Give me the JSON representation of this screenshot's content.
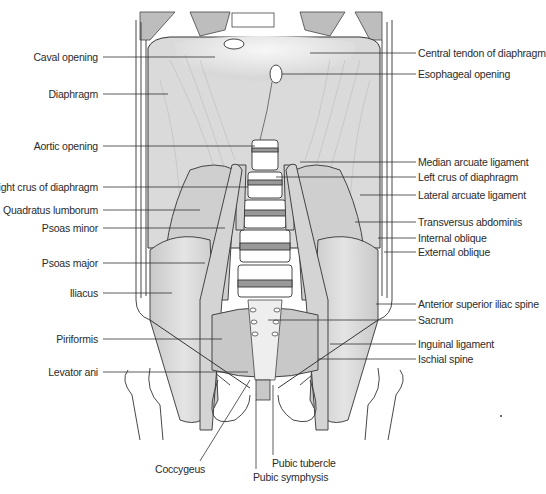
{
  "figure": {
    "labels_left": [
      {
        "text": "Caval opening",
        "x": 100,
        "y": 57,
        "tx": 215,
        "ty": 57
      },
      {
        "text": "Diaphragm",
        "x": 100,
        "y": 94,
        "tx": 168,
        "ty": 94
      },
      {
        "text": "Aortic opening",
        "x": 100,
        "y": 146,
        "tx": 255,
        "ty": 146
      },
      {
        "text": "Right crus of diaphragm",
        "x": 100,
        "y": 187,
        "tx": 248,
        "ty": 187
      },
      {
        "text": "Quadratus lumborum",
        "x": 100,
        "y": 210,
        "tx": 200,
        "ty": 210
      },
      {
        "text": "Psoas minor",
        "x": 100,
        "y": 228,
        "tx": 225,
        "ty": 228
      },
      {
        "text": "Psoas major",
        "x": 100,
        "y": 263,
        "tx": 205,
        "ty": 263
      },
      {
        "text": "Iliacus",
        "x": 100,
        "y": 293,
        "tx": 172,
        "ty": 293
      },
      {
        "text": "Piriformis",
        "x": 100,
        "y": 339,
        "tx": 222,
        "ty": 339
      },
      {
        "text": "Levator ani",
        "x": 100,
        "y": 372,
        "tx": 248,
        "ty": 372
      }
    ],
    "labels_right": [
      {
        "text": "Central tendon of diaphragm",
        "x": 416,
        "y": 53,
        "tx": 310,
        "ty": 53
      },
      {
        "text": "Esophageal opening",
        "x": 416,
        "y": 74,
        "tx": 282,
        "ty": 74
      },
      {
        "text": "Median arcuate ligament",
        "x": 416,
        "y": 162,
        "tx": 300,
        "ty": 162
      },
      {
        "text": "Left crus of diaphragm",
        "x": 416,
        "y": 177,
        "tx": 276,
        "ty": 177
      },
      {
        "text": "Lateral arcuate ligament",
        "x": 416,
        "y": 195,
        "tx": 360,
        "ty": 195
      },
      {
        "text": "Transversus abdominis",
        "x": 416,
        "y": 222,
        "tx": 355,
        "ty": 222
      },
      {
        "text": "Internal oblique",
        "x": 416,
        "y": 238,
        "tx": 378,
        "ty": 238
      },
      {
        "text": "External oblique",
        "x": 416,
        "y": 252,
        "tx": 384,
        "ty": 252
      },
      {
        "text": "Anterior superior iliac spine",
        "x": 416,
        "y": 304,
        "tx": 376,
        "ty": 304
      },
      {
        "text": "Sacrum",
        "x": 416,
        "y": 320,
        "tx": 268,
        "ty": 320
      },
      {
        "text": "Inguinal ligament",
        "x": 416,
        "y": 344,
        "tx": 330,
        "ty": 344
      },
      {
        "text": "Ischial spine",
        "x": 416,
        "y": 359,
        "tx": 318,
        "ty": 359
      }
    ],
    "labels_bottom": [
      {
        "text": "Coccygeus",
        "x": 155,
        "y": 469,
        "tx": 250,
        "ty": 380
      },
      {
        "text": "Pubic tubercle",
        "x": 272,
        "y": 463,
        "tx": 273,
        "ty": 385
      },
      {
        "text": "Pubic symphysis",
        "x": 253,
        "y": 477,
        "tx": 256,
        "ty": 400
      }
    ]
  }
}
